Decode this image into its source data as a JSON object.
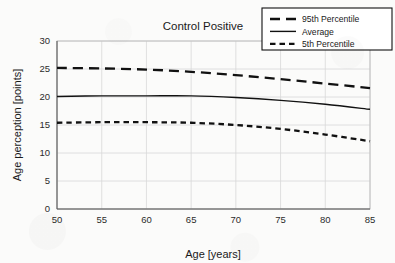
{
  "chart_data": {
    "type": "line",
    "title": "Control Positive",
    "xlabel": "Age [years]",
    "ylabel": "Age perception [points]",
    "xlim": [
      50,
      85
    ],
    "ylim": [
      0,
      30
    ],
    "xticks": [
      50,
      55,
      60,
      65,
      70,
      75,
      80,
      85
    ],
    "yticks": [
      0,
      5,
      10,
      15,
      20,
      25,
      30
    ],
    "grid": true,
    "legend_position": "top-right",
    "x": [
      50,
      55,
      60,
      65,
      70,
      75,
      80,
      85
    ],
    "series": [
      {
        "name": "95th Percentile",
        "style": "long-dashed",
        "values": [
          25.2,
          25.1,
          24.9,
          24.5,
          23.9,
          23.2,
          22.4,
          21.6
        ]
      },
      {
        "name": "Average",
        "style": "solid",
        "values": [
          20.1,
          20.2,
          20.2,
          20.2,
          19.9,
          19.4,
          18.7,
          17.8
        ]
      },
      {
        "name": "5th Percentile",
        "style": "short-dashed",
        "values": [
          15.4,
          15.5,
          15.5,
          15.4,
          15.0,
          14.3,
          13.3,
          12.1
        ]
      }
    ]
  },
  "legend": {
    "entries": [
      {
        "label": "95th Percentile",
        "style": "long-dashed"
      },
      {
        "label": "Average",
        "style": "solid"
      },
      {
        "label": "5th Percentile",
        "style": "short-dashed"
      }
    ]
  },
  "colors": {
    "series": "#111111",
    "grid": "#d8d8d8",
    "frame": "#bdbdbd",
    "axis": "#555555",
    "background": "#fbfbfa",
    "text": "#1a1a1a"
  }
}
